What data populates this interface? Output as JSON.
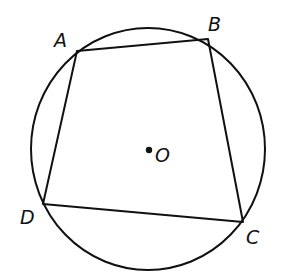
{
  "diagram": {
    "type": "cyclic-quadrilateral-in-circle",
    "circle": {
      "center": "O",
      "cx": 148,
      "cy": 149,
      "rx": 117,
      "ry": 121
    },
    "points": [
      {
        "name": "A",
        "x": 77,
        "y": 51,
        "label_x": 54,
        "label_y": 47
      },
      {
        "name": "B",
        "x": 208,
        "y": 39,
        "label_x": 208,
        "label_y": 31
      },
      {
        "name": "C",
        "x": 243,
        "y": 222,
        "label_x": 246,
        "label_y": 244
      },
      {
        "name": "D",
        "x": 43,
        "y": 204,
        "label_x": 20,
        "label_y": 224
      }
    ],
    "center_point": {
      "name": "O",
      "x": 149,
      "y": 150,
      "label_x": 155,
      "label_y": 162
    },
    "colors": {
      "stroke": "#111111",
      "background": "#ffffff"
    }
  }
}
